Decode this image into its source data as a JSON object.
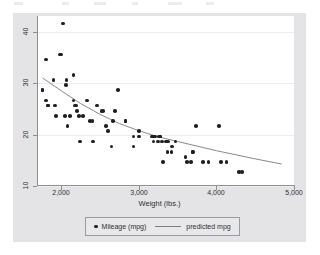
{
  "figure": {
    "background_color": "#ffffff",
    "graph_region_color": "#e4e4e6",
    "plot_region_color": "#ffffff",
    "marker_color": "#1f1f24",
    "line_color": "#7b7b82",
    "grid_color": "#ededf0",
    "axis_color": "#8e8e93"
  },
  "chart_data": {
    "type": "scatter",
    "title": "",
    "xlabel": "Weight (lbs.)",
    "ylabel": "",
    "xlim": [
      1700,
      5000
    ],
    "ylim": [
      9.5,
      42.5
    ],
    "xticks": [
      2000,
      3000,
      4000,
      5000
    ],
    "xticklabels": [
      "2,000",
      "3,000",
      "4,000",
      "5,000"
    ],
    "yticks": [
      10,
      20,
      30,
      40
    ],
    "yticklabels": [
      "10",
      "20",
      "30",
      "40"
    ],
    "grid": "horizontal",
    "legend_position": "bottom",
    "series": [
      {
        "name": "Mileage (mpg)",
        "type": "scatter",
        "marker": "circle",
        "color": "#1f1f24",
        "points": [
          [
            1760,
            28
          ],
          [
            1760,
            28
          ],
          [
            1800,
            34
          ],
          [
            1800,
            26
          ],
          [
            1830,
            25
          ],
          [
            1830,
            25
          ],
          [
            1900,
            30
          ],
          [
            1920,
            25
          ],
          [
            1930,
            23
          ],
          [
            1980,
            35
          ],
          [
            2000,
            35
          ],
          [
            2020,
            41
          ],
          [
            2050,
            23
          ],
          [
            2060,
            29
          ],
          [
            2070,
            30
          ],
          [
            2080,
            21
          ],
          [
            2110,
            23
          ],
          [
            2160,
            31
          ],
          [
            2160,
            26
          ],
          [
            2170,
            25
          ],
          [
            2190,
            25
          ],
          [
            2200,
            24
          ],
          [
            2230,
            23
          ],
          [
            2240,
            18
          ],
          [
            2280,
            23
          ],
          [
            2330,
            26
          ],
          [
            2370,
            22
          ],
          [
            2400,
            22
          ],
          [
            2410,
            18
          ],
          [
            2460,
            25
          ],
          [
            2520,
            24
          ],
          [
            2540,
            24
          ],
          [
            2580,
            21
          ],
          [
            2600,
            20
          ],
          [
            2650,
            17
          ],
          [
            2670,
            22
          ],
          [
            2690,
            24
          ],
          [
            2730,
            28
          ],
          [
            2830,
            22
          ],
          [
            2830,
            22
          ],
          [
            2930,
            19
          ],
          [
            2930,
            17
          ],
          [
            3000,
            19
          ],
          [
            3000,
            20
          ],
          [
            3170,
            19
          ],
          [
            3180,
            19
          ],
          [
            3190,
            18
          ],
          [
            3200,
            19
          ],
          [
            3210,
            19
          ],
          [
            3250,
            18
          ],
          [
            3260,
            19
          ],
          [
            3280,
            19
          ],
          [
            3280,
            19
          ],
          [
            3300,
            18
          ],
          [
            3310,
            14
          ],
          [
            3350,
            18
          ],
          [
            3360,
            18
          ],
          [
            3370,
            16
          ],
          [
            3380,
            18
          ],
          [
            3420,
            16
          ],
          [
            3430,
            17
          ],
          [
            3470,
            18
          ],
          [
            3600,
            15
          ],
          [
            3620,
            14
          ],
          [
            3670,
            14
          ],
          [
            3690,
            16
          ],
          [
            3700,
            16
          ],
          [
            3740,
            21
          ],
          [
            3830,
            14
          ],
          [
            3900,
            14
          ],
          [
            4030,
            21
          ],
          [
            4060,
            14
          ],
          [
            4130,
            14
          ],
          [
            4290,
            12
          ],
          [
            4330,
            12
          ]
        ]
      },
      {
        "name": "predicted mpg",
        "type": "line",
        "color": "#7b7b82",
        "fit": {
          "form": "quadratic",
          "x_start": 1760,
          "x_end": 4840,
          "points": [
            [
              1760,
              30.4
            ],
            [
              2000,
              27.9
            ],
            [
              2250,
              25.4
            ],
            [
              2500,
              23.3
            ],
            [
              2750,
              21.5
            ],
            [
              3000,
              20.1
            ],
            [
              3250,
              18.9
            ],
            [
              3500,
              18.0
            ],
            [
              3750,
              17.1
            ],
            [
              4000,
              16.2
            ],
            [
              4250,
              15.4
            ],
            [
              4500,
              14.6
            ],
            [
              4840,
              13.6
            ]
          ]
        }
      }
    ]
  },
  "legend": {
    "scatter_label": "Mileage (mpg)",
    "line_label": "predicted mpg",
    "scatter_marker_name": "scatter-marker-icon",
    "line_marker_name": "line-sample-icon"
  }
}
